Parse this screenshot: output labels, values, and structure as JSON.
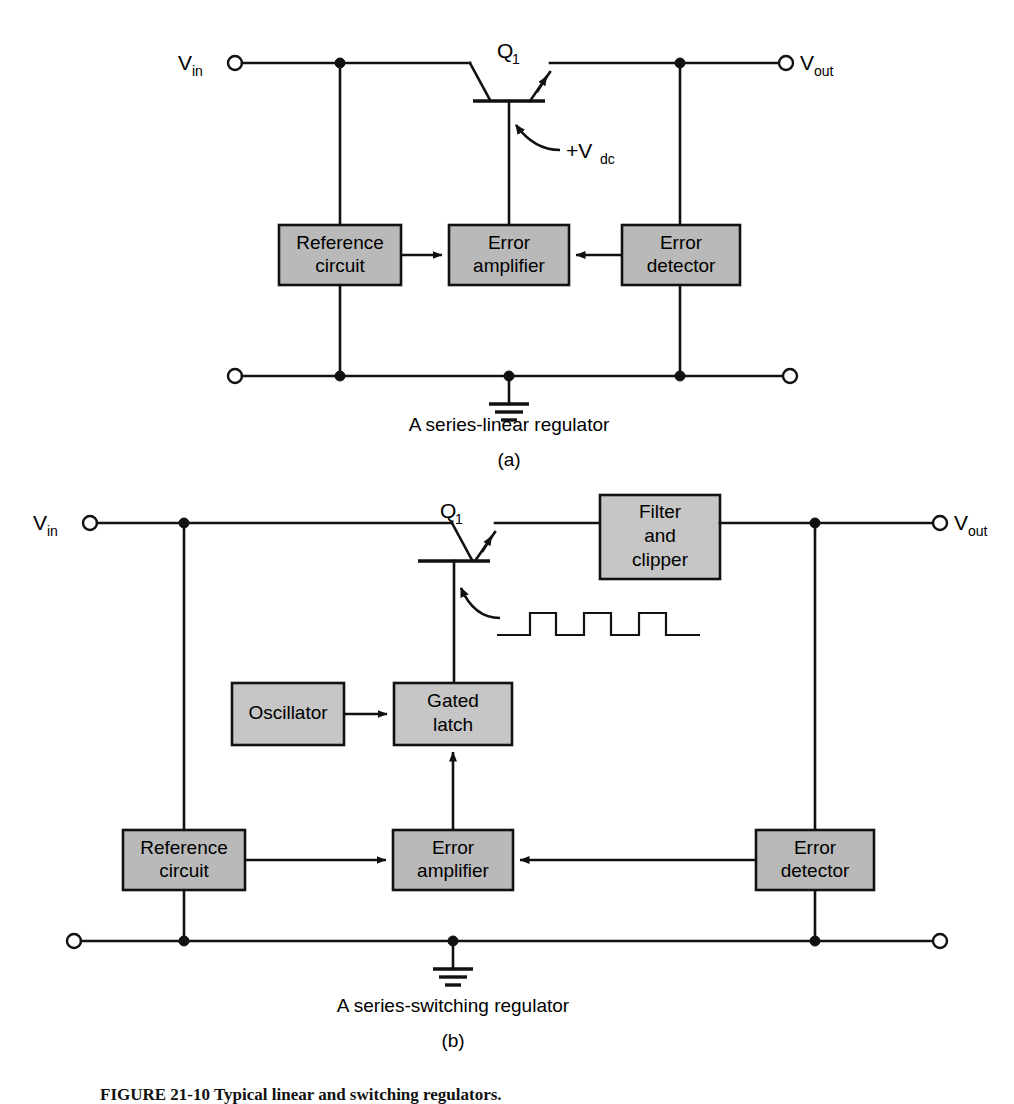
{
  "figure": {
    "caption_label": "FIGURE 21-10",
    "caption_text": "Typical linear and switching regulators."
  },
  "panel_a": {
    "letter": "(a)",
    "caption": "A series-linear regulator",
    "terminals": {
      "input_label": "V",
      "input_sub": "in",
      "output_label": "V",
      "output_sub": "out"
    },
    "transistor": {
      "label": "Q",
      "label_sub": "1",
      "bias_label": "+V",
      "bias_sub": "dc"
    },
    "blocks": [
      {
        "line1": "Reference",
        "line2": "circuit"
      },
      {
        "line1": "Error",
        "line2": "amplifier"
      },
      {
        "line1": "Error",
        "line2": "detector"
      }
    ]
  },
  "panel_b": {
    "letter": "(b)",
    "caption": "A series-switching regulator",
    "terminals": {
      "input_label": "V",
      "input_sub": "in",
      "output_label": "V",
      "output_sub": "out"
    },
    "transistor": {
      "label": "Q",
      "label_sub": "1"
    },
    "blocks": [
      {
        "line1": "Filter",
        "line2": "and",
        "line3": "clipper"
      },
      {
        "line1": "Oscillator"
      },
      {
        "line1": "Gated",
        "line2": "latch"
      },
      {
        "line1": "Reference",
        "line2": "circuit"
      },
      {
        "line1": "Error",
        "line2": "amplifier"
      },
      {
        "line1": "Error",
        "line2": "detector"
      }
    ]
  },
  "colors": {
    "block_fill": "#b9b9b9",
    "block_fill_light": "#c6c6c6",
    "wire": "#111111",
    "background": "#ffffff"
  }
}
